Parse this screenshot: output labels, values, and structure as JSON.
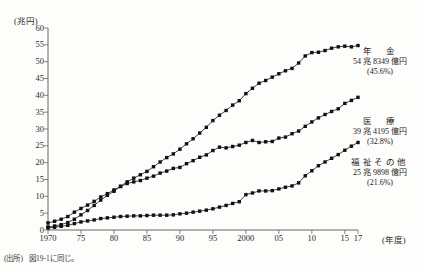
{
  "figure": {
    "title_partial": "",
    "unit_label": "(兆円)",
    "x_unit_label": "(年度)",
    "source_tag": "(出所)",
    "source_text": "図19-1に同じ。"
  },
  "annotations": [
    {
      "name": "年　金",
      "amount": "54 兆 8349 億円",
      "percent": "(45.6%)"
    },
    {
      "name": "医　療",
      "amount": "39 兆 4195 億円",
      "percent": "(32.8%)"
    },
    {
      "name": "福祉その他",
      "amount": "25 兆 9898 億円",
      "percent": "(21.6%)"
    }
  ],
  "chart_data": {
    "type": "line",
    "title": "",
    "xlabel": "(年度)",
    "ylabel": "(兆円)",
    "xlim": [
      1970,
      2017
    ],
    "ylim": [
      0,
      60
    ],
    "ytick_labels": [
      "0",
      "5",
      "10",
      "15",
      "20",
      "25",
      "30",
      "35",
      "40",
      "45",
      "50",
      "55",
      "60"
    ],
    "ytick_values": [
      0,
      5,
      10,
      15,
      20,
      25,
      30,
      35,
      40,
      45,
      50,
      55,
      60
    ],
    "xtick_labels": [
      "1970",
      "75",
      "80",
      "85",
      "90",
      "95",
      "2000",
      "05",
      "10",
      "15",
      "17"
    ],
    "xtick_values": [
      1970,
      1975,
      1980,
      1985,
      1990,
      1995,
      2000,
      2005,
      2010,
      2015,
      2017
    ],
    "grid": false,
    "legend": "annotations-at-line-ends",
    "marker": "filled-square",
    "x": [
      1970,
      1971,
      1972,
      1973,
      1974,
      1975,
      1976,
      1977,
      1978,
      1979,
      1980,
      1981,
      1982,
      1983,
      1984,
      1985,
      1986,
      1987,
      1988,
      1989,
      1990,
      1991,
      1992,
      1993,
      1994,
      1995,
      1996,
      1997,
      1998,
      1999,
      2000,
      2001,
      2002,
      2003,
      2004,
      2005,
      2006,
      2007,
      2008,
      2009,
      2010,
      2011,
      2012,
      2013,
      2014,
      2015,
      2016,
      2017
    ],
    "series": [
      {
        "name": "年金",
        "label": "年　金",
        "final_value_text": "54 兆 8349 億円",
        "final_share_text": "(45.6%)",
        "values": [
          0.9,
          1.2,
          1.6,
          2.2,
          3.2,
          4.5,
          5.8,
          7.3,
          8.9,
          10.3,
          11.5,
          13.0,
          14.3,
          15.4,
          16.4,
          17.4,
          18.8,
          20.2,
          21.5,
          22.6,
          24.0,
          25.6,
          27.1,
          28.8,
          30.5,
          32.5,
          34.1,
          35.5,
          37.1,
          38.4,
          40.5,
          42.1,
          43.6,
          44.4,
          45.4,
          46.4,
          47.3,
          48.0,
          49.6,
          51.7,
          52.7,
          52.8,
          53.3,
          54.0,
          54.4,
          54.6,
          54.4,
          54.8
        ]
      },
      {
        "name": "医療",
        "label": "医　療",
        "final_value_text": "39 兆 4195 億円",
        "final_share_text": "(32.8%)",
        "values": [
          2.1,
          2.6,
          3.2,
          4.0,
          5.3,
          6.4,
          7.4,
          8.5,
          9.8,
          10.8,
          11.9,
          12.9,
          13.8,
          14.3,
          14.7,
          15.4,
          16.0,
          16.9,
          17.5,
          18.3,
          18.6,
          19.7,
          20.6,
          21.6,
          22.3,
          23.6,
          24.6,
          24.4,
          24.8,
          25.2,
          26.0,
          26.6,
          26.0,
          26.2,
          26.3,
          27.3,
          27.6,
          28.6,
          29.4,
          30.8,
          32.1,
          33.3,
          34.3,
          35.2,
          36.0,
          37.6,
          38.5,
          39.4
        ]
      },
      {
        "name": "福祉その他",
        "label": "福祉その他",
        "final_value_text": "25 兆 9898 億円",
        "final_share_text": "(21.6%)",
        "values": [
          0.6,
          0.8,
          1.1,
          1.4,
          1.9,
          2.4,
          2.7,
          3.0,
          3.4,
          3.6,
          3.8,
          4.0,
          4.1,
          4.2,
          4.2,
          4.3,
          4.4,
          4.4,
          4.4,
          4.5,
          4.8,
          5.0,
          5.3,
          5.6,
          5.9,
          6.3,
          6.8,
          7.3,
          7.9,
          8.4,
          10.5,
          11.0,
          11.6,
          11.6,
          11.7,
          12.2,
          12.7,
          13.1,
          14.0,
          16.1,
          17.6,
          19.1,
          20.2,
          21.3,
          22.4,
          23.7,
          24.9,
          26.0
        ]
      }
    ]
  }
}
